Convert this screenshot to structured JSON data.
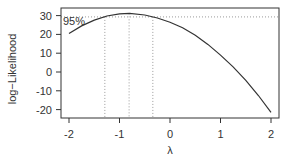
{
  "chart_data": {
    "type": "line",
    "title": "",
    "xlabel": "λ",
    "ylabel": "log−Likelihood",
    "xlim": [
      -2.16,
      2.16
    ],
    "ylim": [
      -25,
      34
    ],
    "x_ticks": [
      -2,
      -1,
      0,
      1,
      2
    ],
    "x_tick_labels": [
      "-2",
      "-1",
      "0",
      "1",
      "2"
    ],
    "y_ticks": [
      -20,
      -10,
      0,
      10,
      20,
      30
    ],
    "y_tick_labels": [
      "-20",
      "-10",
      "0",
      "10",
      "20",
      "30"
    ],
    "grid": false,
    "series": [
      {
        "name": "profile log-likelihood",
        "x": [
          -2.0,
          -1.75,
          -1.5,
          -1.25,
          -1.0,
          -0.8,
          -0.5,
          -0.25,
          0.0,
          0.25,
          0.5,
          0.75,
          1.0,
          1.25,
          1.5,
          1.75,
          2.0
        ],
        "y": [
          20.5,
          24.5,
          27.6,
          29.8,
          30.9,
          31.2,
          30.3,
          28.7,
          26.5,
          23.5,
          19.5,
          14.7,
          9.0,
          2.7,
          -4.4,
          -12.5,
          -21.5
        ]
      }
    ],
    "annotations": {
      "confidence_label": "95%",
      "threshold_y": 29.3,
      "lambda_lower": -1.29,
      "lambda_hat": -0.81,
      "lambda_upper": -0.34
    }
  }
}
